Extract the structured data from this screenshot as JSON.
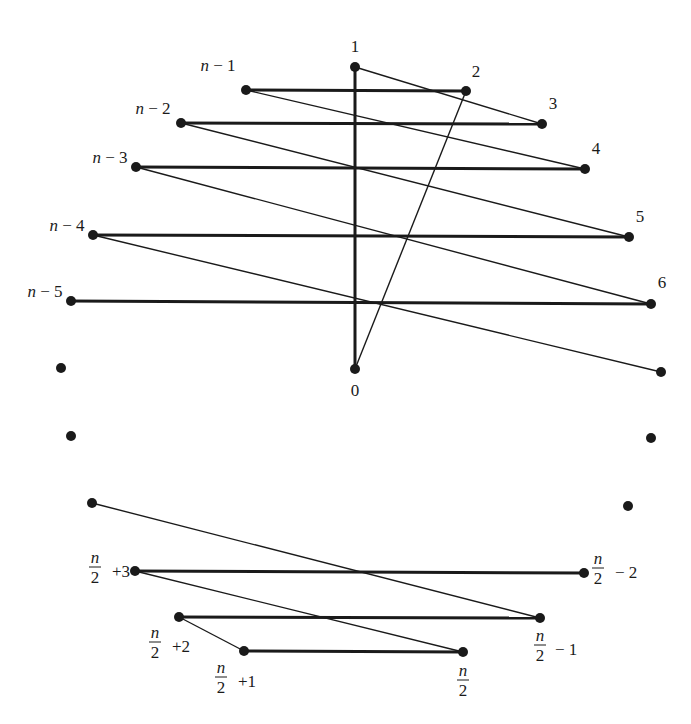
{
  "figure": {
    "stroke_color": "#1a1a1a",
    "background": "#ffffff"
  },
  "vertices": [
    {
      "id": "v1",
      "label": "1",
      "x": 355,
      "y": 67,
      "lx": 355,
      "ly": 52,
      "anchor": "middle"
    },
    {
      "id": "v2",
      "label": "2",
      "x": 466,
      "y": 91,
      "lx": 476,
      "ly": 77,
      "anchor": "middle"
    },
    {
      "id": "v3",
      "label": "3",
      "x": 542,
      "y": 124,
      "lx": 553,
      "ly": 109,
      "anchor": "middle"
    },
    {
      "id": "v4",
      "label": "4",
      "x": 585,
      "y": 169,
      "lx": 596,
      "ly": 154,
      "anchor": "middle"
    },
    {
      "id": "v5",
      "label": "5",
      "x": 629,
      "y": 237,
      "lx": 640,
      "ly": 222,
      "anchor": "middle"
    },
    {
      "id": "v6",
      "label": "6",
      "x": 651,
      "y": 304,
      "lx": 662,
      "ly": 288,
      "anchor": "middle"
    },
    {
      "id": "v0",
      "label": "0",
      "x": 355,
      "y": 369,
      "lx": 355,
      "ly": 396,
      "anchor": "middle"
    },
    {
      "id": "vn1",
      "label": "n − 1",
      "x": 246,
      "y": 90,
      "lx": 218,
      "ly": 71,
      "anchor": "middle"
    },
    {
      "id": "vn2",
      "label": "n − 2",
      "x": 181,
      "y": 123,
      "lx": 153,
      "ly": 114,
      "anchor": "middle"
    },
    {
      "id": "vn3",
      "label": "n − 3",
      "x": 136,
      "y": 167,
      "lx": 110,
      "ly": 163,
      "anchor": "middle"
    },
    {
      "id": "vn4",
      "label": "n − 4",
      "x": 93,
      "y": 235,
      "lx": 67,
      "ly": 231,
      "anchor": "middle"
    },
    {
      "id": "vn5",
      "label": "n − 5",
      "x": 71,
      "y": 301,
      "lx": 45,
      "ly": 297,
      "anchor": "middle"
    },
    {
      "id": "r7",
      "label": "",
      "x": 661,
      "y": 372
    },
    {
      "id": "l1",
      "label": "",
      "x": 61,
      "y": 368
    },
    {
      "id": "l2",
      "label": "",
      "x": 71,
      "y": 436
    },
    {
      "id": "r8",
      "label": "",
      "x": 651,
      "y": 438
    },
    {
      "id": "r9",
      "label": "",
      "x": 628,
      "y": 506
    },
    {
      "id": "l3",
      "label": "",
      "x": 92,
      "y": 503
    },
    {
      "id": "vh3",
      "label": "n/2 +3",
      "x": 135,
      "y": 571
    },
    {
      "id": "vhm2",
      "label": "n/2 − 2",
      "x": 584,
      "y": 573
    },
    {
      "id": "vh2",
      "label": "n/2 +2",
      "x": 179,
      "y": 617
    },
    {
      "id": "vhm1",
      "label": "n/2 − 1",
      "x": 540,
      "y": 618
    },
    {
      "id": "vh1",
      "label": "n/2 +1",
      "x": 244,
      "y": 651
    },
    {
      "id": "vh",
      "label": "n/2",
      "x": 463,
      "y": 652
    }
  ],
  "fraction_labels": [
    {
      "id": "vh3",
      "num": "n",
      "den": "2",
      "suffix": "+3",
      "fx": 95,
      "fy": 567,
      "sx": 112,
      "sy": 577
    },
    {
      "id": "vhm2",
      "num": "n",
      "den": "2",
      "suffix": "− 2",
      "fx": 598,
      "fy": 568,
      "sx": 615,
      "sy": 578
    },
    {
      "id": "vh2",
      "num": "n",
      "den": "2",
      "suffix": "+2",
      "fx": 155,
      "fy": 642,
      "sx": 172,
      "sy": 652
    },
    {
      "id": "vhm1",
      "num": "n",
      "den": "2",
      "suffix": "− 1",
      "fx": 540,
      "fy": 645,
      "sx": 555,
      "sy": 655
    },
    {
      "id": "vh1",
      "num": "n",
      "den": "2",
      "suffix": "+1",
      "fx": 221,
      "fy": 677,
      "sx": 238,
      "sy": 687
    },
    {
      "id": "vh",
      "num": "n",
      "den": "2",
      "suffix": "",
      "fx": 463,
      "fy": 680,
      "sx": 0,
      "sy": 0
    }
  ],
  "edges": {
    "bold": [
      [
        "v1",
        "v0"
      ],
      [
        "vn1",
        "v2"
      ],
      [
        "vn2",
        "v3"
      ],
      [
        "vn3",
        "v4"
      ],
      [
        "vn4",
        "v5"
      ],
      [
        "vn5",
        "v6"
      ],
      [
        "vh3",
        "vhm2"
      ],
      [
        "vh2",
        "vhm1"
      ],
      [
        "vh1",
        "vh"
      ]
    ],
    "thin": [
      [
        "v1",
        "v3"
      ],
      [
        "v0",
        "v2"
      ],
      [
        "vn1",
        "v4"
      ],
      [
        "vn2",
        "v5"
      ],
      [
        "vn3",
        "v6"
      ],
      [
        "vn4",
        "r7"
      ],
      [
        "l3",
        "vhm1"
      ],
      [
        "vh3",
        "vh"
      ],
      [
        "vh2",
        "vh1"
      ]
    ]
  }
}
